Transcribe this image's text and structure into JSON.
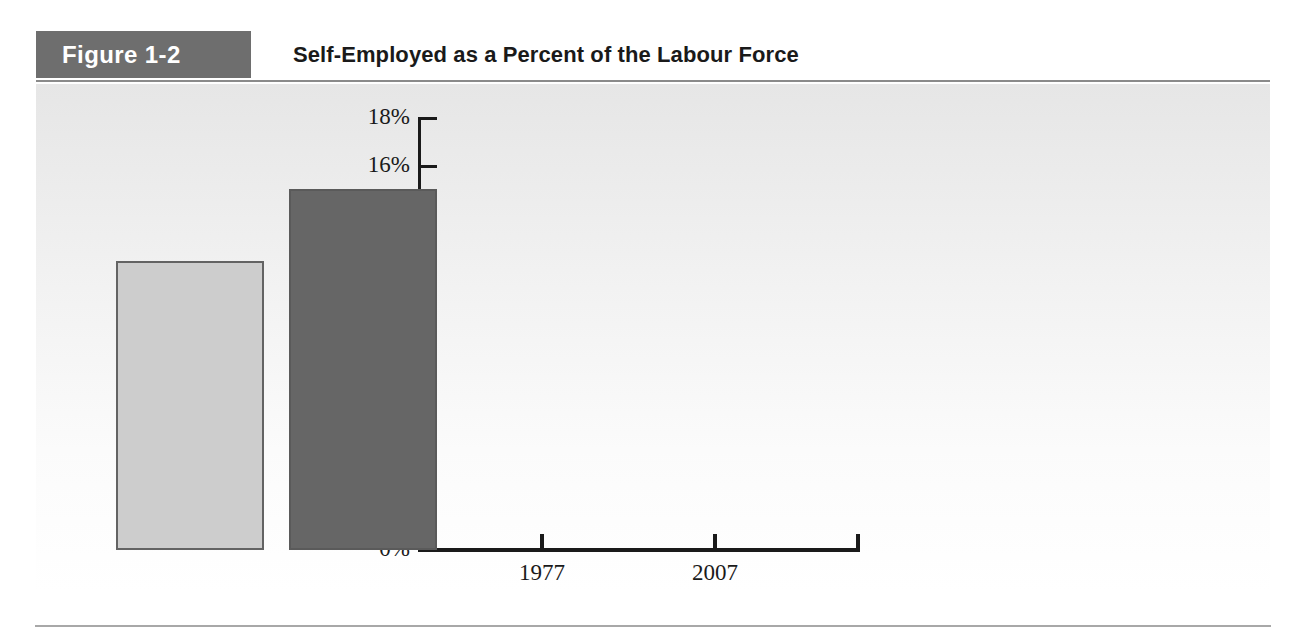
{
  "figure": {
    "badge_label": "Figure 1-2",
    "title": "Self-Employed as a Percent of the Labour Force"
  },
  "colors": {
    "badge_background": "#6e6e6e",
    "bar_1977": "#cdcdcd",
    "bar_2007": "#666666",
    "axis": "#1a1a1a",
    "rule": "#8a8a8a"
  },
  "chart_data": {
    "type": "bar",
    "title": "Self-Employed as a Percent of the Labour Force",
    "categories": [
      "1977",
      "2007"
    ],
    "values": [
      12,
      15
    ],
    "value_labels": [
      "12%",
      "15%"
    ],
    "xlabel": "",
    "ylabel": "",
    "ylim": [
      0,
      18
    ],
    "ytick_values": [
      0,
      2,
      4,
      6,
      8,
      10,
      12,
      14,
      16,
      18
    ],
    "ytick_labels": [
      "0%",
      "2%",
      "4%",
      "6%",
      "8%",
      "10%",
      "12%",
      "14%",
      "16%",
      "18%"
    ],
    "grid": false,
    "legend": false,
    "series": [
      {
        "name": "Self-employed share of labour force",
        "values": [
          12,
          15
        ],
        "colors": [
          "#cdcdcd",
          "#666666"
        ]
      }
    ]
  }
}
